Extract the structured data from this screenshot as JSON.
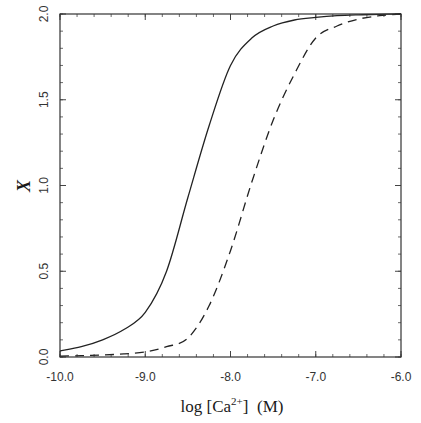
{
  "chart_data": {
    "type": "line",
    "title": "",
    "xlabel": "log [Ca2+]  (M)",
    "xlabel_parts": {
      "prefix": "log [Ca",
      "superscript": "2+",
      "suffix": "]  (M)"
    },
    "ylabel": "X",
    "xlim": [
      -10.0,
      -6.0
    ],
    "ylim": [
      0.0,
      2.0
    ],
    "x_ticks": [
      -10.0,
      -9.0,
      -8.0,
      -7.0,
      -6.0
    ],
    "x_tick_labels": [
      "-10.0",
      "-9.0",
      "-8.0",
      "-7.0",
      "-6.0"
    ],
    "x_minor_step": 0.2,
    "y_ticks": [
      0.0,
      0.5,
      1.0,
      1.5,
      2.0
    ],
    "y_tick_labels": [
      "0.0",
      "0.5",
      "1.0",
      "1.5",
      "2.0"
    ],
    "y_minor_step": 0.1,
    "grid": false,
    "legend": null,
    "x": [
      -10.0,
      -9.75,
      -9.5,
      -9.25,
      -9.0,
      -8.75,
      -8.5,
      -8.25,
      -8.0,
      -7.75,
      -7.5,
      -7.25,
      -7.0,
      -6.75,
      -6.5,
      -6.25,
      -6.0
    ],
    "series": [
      {
        "name": "solid",
        "style": "solid",
        "color": "#222222",
        "values": [
          0.035,
          0.06,
          0.1,
          0.16,
          0.26,
          0.5,
          0.93,
          1.35,
          1.7,
          1.86,
          1.93,
          1.965,
          1.98,
          1.99,
          1.995,
          1.998,
          2.0
        ]
      },
      {
        "name": "dashed",
        "style": "dashed",
        "color": "#222222",
        "values": [
          0.005,
          0.008,
          0.012,
          0.018,
          0.03,
          0.06,
          0.11,
          0.3,
          0.62,
          1.02,
          1.38,
          1.65,
          1.86,
          1.93,
          1.97,
          1.99,
          2.0
        ]
      }
    ]
  }
}
